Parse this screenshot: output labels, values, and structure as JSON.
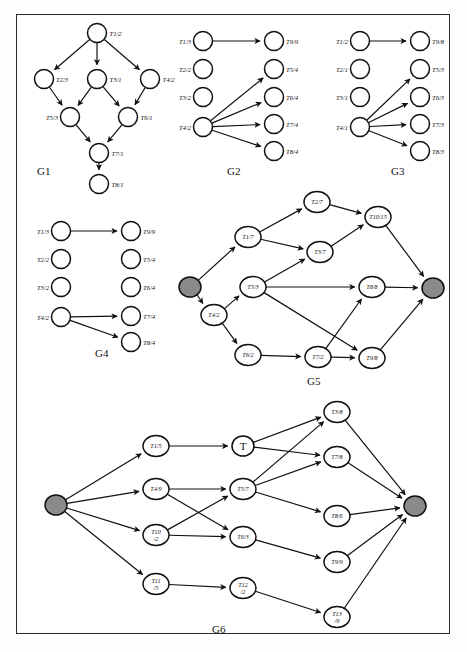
{
  "figure": {
    "background": "#ffffff",
    "border_color": "#2b2b2b",
    "node_fill": "#ffffff",
    "terminal_fill": "#8a8a8a",
    "edge_color": "#111111"
  },
  "captions": {
    "g1": "G1",
    "g2": "G2",
    "g3": "G3",
    "g4": "G4",
    "g5": "G5",
    "g6": "G6"
  },
  "graphs": {
    "g1": {
      "name": "G1",
      "label_position": "outside",
      "nodes": [
        {
          "id": "n1",
          "label": "T1/2",
          "x": 97,
          "y": 33
        },
        {
          "id": "n2",
          "label": "T2/3",
          "x": 44,
          "y": 79
        },
        {
          "id": "n3",
          "label": "T3/1",
          "x": 97,
          "y": 79
        },
        {
          "id": "n4",
          "label": "T4/2",
          "x": 150,
          "y": 79
        },
        {
          "id": "n5",
          "label": "T5/3",
          "x": 70,
          "y": 117
        },
        {
          "id": "n6",
          "label": "T6/1",
          "x": 128,
          "y": 117
        },
        {
          "id": "n7",
          "label": "T7/1",
          "x": 99,
          "y": 153
        },
        {
          "id": "n8",
          "label": "T8/1",
          "x": 99,
          "y": 184
        }
      ],
      "edges": [
        [
          "n1",
          "n2"
        ],
        [
          "n1",
          "n3"
        ],
        [
          "n1",
          "n4"
        ],
        [
          "n2",
          "n5"
        ],
        [
          "n3",
          "n5"
        ],
        [
          "n3",
          "n6"
        ],
        [
          "n4",
          "n6"
        ],
        [
          "n5",
          "n7"
        ],
        [
          "n6",
          "n7"
        ],
        [
          "n7",
          "n8"
        ]
      ]
    },
    "g2": {
      "name": "G2",
      "left_nodes": [
        {
          "id": "a1",
          "label": "T1/3",
          "x": 203,
          "y": 41
        },
        {
          "id": "a2",
          "label": "T2/2",
          "x": 203,
          "y": 69
        },
        {
          "id": "a3",
          "label": "T3/2",
          "x": 203,
          "y": 97
        },
        {
          "id": "a4",
          "label": "T4/2",
          "x": 203,
          "y": 127
        }
      ],
      "right_nodes": [
        {
          "id": "b9",
          "label": "T9/9",
          "x": 274,
          "y": 41
        },
        {
          "id": "b5",
          "label": "T5/4",
          "x": 274,
          "y": 69
        },
        {
          "id": "b6",
          "label": "T6/4",
          "x": 274,
          "y": 97
        },
        {
          "id": "b7",
          "label": "T7/4",
          "x": 274,
          "y": 124
        },
        {
          "id": "b8",
          "label": "T8/4",
          "x": 274,
          "y": 151
        }
      ],
      "edges": [
        [
          "a1",
          "b9"
        ],
        [
          "a4",
          "b5"
        ],
        [
          "a4",
          "b6"
        ],
        [
          "a4",
          "b7"
        ],
        [
          "a4",
          "b8"
        ]
      ]
    },
    "g3": {
      "name": "G3",
      "left_nodes": [
        {
          "id": "c1",
          "label": "T1/2",
          "x": 360,
          "y": 41
        },
        {
          "id": "c2",
          "label": "T2/1",
          "x": 360,
          "y": 69
        },
        {
          "id": "c3",
          "label": "T3/1",
          "x": 360,
          "y": 97
        },
        {
          "id": "c4",
          "label": "T4/1",
          "x": 360,
          "y": 127
        }
      ],
      "right_nodes": [
        {
          "id": "d9",
          "label": "T9/8",
          "x": 420,
          "y": 41
        },
        {
          "id": "d5",
          "label": "T5/3",
          "x": 420,
          "y": 69
        },
        {
          "id": "d6",
          "label": "T6/3",
          "x": 420,
          "y": 97
        },
        {
          "id": "d7",
          "label": "T7/3",
          "x": 420,
          "y": 124
        },
        {
          "id": "d8",
          "label": "T8/3",
          "x": 420,
          "y": 151
        }
      ],
      "edges": [
        [
          "c1",
          "d9"
        ],
        [
          "c4",
          "d5"
        ],
        [
          "c4",
          "d6"
        ],
        [
          "c4",
          "d7"
        ],
        [
          "c4",
          "d8"
        ]
      ]
    },
    "g4": {
      "name": "G4",
      "left_nodes": [
        {
          "id": "e1",
          "label": "T1/3",
          "x": 61,
          "y": 231
        },
        {
          "id": "e2",
          "label": "T2/2",
          "x": 61,
          "y": 259
        },
        {
          "id": "e3",
          "label": "T3/2",
          "x": 61,
          "y": 287
        },
        {
          "id": "e4",
          "label": "T4/2",
          "x": 61,
          "y": 317
        }
      ],
      "right_nodes": [
        {
          "id": "f9",
          "label": "T9/9",
          "x": 131,
          "y": 231
        },
        {
          "id": "f5",
          "label": "T5/4",
          "x": 131,
          "y": 259
        },
        {
          "id": "f6",
          "label": "T6/4",
          "x": 131,
          "y": 287
        },
        {
          "id": "f7",
          "label": "T7/4",
          "x": 131,
          "y": 316
        },
        {
          "id": "f8",
          "label": "T8/4",
          "x": 131,
          "y": 342
        }
      ],
      "edges": [
        [
          "e1",
          "f9"
        ],
        [
          "e4",
          "f7"
        ],
        [
          "e4",
          "f8"
        ]
      ]
    },
    "g5": {
      "name": "G5",
      "nodes": [
        {
          "id": "s",
          "label": "",
          "x": 190,
          "y": 287,
          "type": "terminal"
        },
        {
          "id": "t1",
          "label": "T1/7",
          "x": 248,
          "y": 237,
          "type": "task"
        },
        {
          "id": "t2",
          "label": "T2/7",
          "x": 317,
          "y": 202,
          "type": "task"
        },
        {
          "id": "t3",
          "label": "T3/7",
          "x": 320,
          "y": 252,
          "type": "task"
        },
        {
          "id": "t4",
          "label": "T4/2",
          "x": 214,
          "y": 315,
          "type": "task"
        },
        {
          "id": "t5",
          "label": "T5/3",
          "x": 253,
          "y": 287,
          "type": "task"
        },
        {
          "id": "t6",
          "label": "T6/2",
          "x": 248,
          "y": 355,
          "type": "task"
        },
        {
          "id": "t7",
          "label": "T7/2",
          "x": 318,
          "y": 357,
          "type": "task"
        },
        {
          "id": "t8",
          "label": "T8/8",
          "x": 372,
          "y": 287,
          "type": "task"
        },
        {
          "id": "t9",
          "label": "T9/8",
          "x": 372,
          "y": 358,
          "type": "task"
        },
        {
          "id": "t10",
          "label": "T10/15",
          "x": 378,
          "y": 217,
          "type": "task"
        },
        {
          "id": "e",
          "label": "",
          "x": 433,
          "y": 288,
          "type": "terminal"
        }
      ],
      "edges": [
        [
          "s",
          "t1"
        ],
        [
          "s",
          "t4"
        ],
        [
          "t1",
          "t2"
        ],
        [
          "t1",
          "t3"
        ],
        [
          "t4",
          "t5"
        ],
        [
          "t4",
          "t6"
        ],
        [
          "t5",
          "t3"
        ],
        [
          "t5",
          "t8"
        ],
        [
          "t5",
          "t9"
        ],
        [
          "t2",
          "t10"
        ],
        [
          "t3",
          "t10"
        ],
        [
          "t6",
          "t7"
        ],
        [
          "t7",
          "t8"
        ],
        [
          "t7",
          "t9"
        ],
        [
          "t10",
          "e"
        ],
        [
          "t8",
          "e"
        ],
        [
          "t9",
          "e"
        ]
      ]
    },
    "g6": {
      "name": "G6",
      "nodes": [
        {
          "id": "s",
          "label": "",
          "x": 56,
          "y": 505,
          "type": "terminal"
        },
        {
          "id": "u1",
          "label": "T1/5",
          "x": 156,
          "y": 446,
          "type": "task"
        },
        {
          "id": "u4",
          "label": "T4/9",
          "x": 156,
          "y": 489,
          "type": "task"
        },
        {
          "id": "u10",
          "label": "T10\n/2",
          "x": 156,
          "y": 535,
          "type": "task"
        },
        {
          "id": "u11",
          "label": "T11\n/5",
          "x": 156,
          "y": 584,
          "type": "task"
        },
        {
          "id": "u2",
          "label": "T",
          "x": 243,
          "y": 446,
          "type": "task-big"
        },
        {
          "id": "u5",
          "label": "T5/7",
          "x": 243,
          "y": 489,
          "type": "task"
        },
        {
          "id": "u6",
          "label": "T6/3",
          "x": 243,
          "y": 537,
          "type": "task"
        },
        {
          "id": "u12",
          "label": "T12\n/2",
          "x": 243,
          "y": 588,
          "type": "task"
        },
        {
          "id": "u3",
          "label": "T3/8",
          "x": 337,
          "y": 412,
          "type": "task"
        },
        {
          "id": "u7",
          "label": "T7/8",
          "x": 337,
          "y": 457,
          "type": "task"
        },
        {
          "id": "u8",
          "label": "T8/6",
          "x": 337,
          "y": 516,
          "type": "task"
        },
        {
          "id": "u9",
          "label": "T9/9",
          "x": 337,
          "y": 562,
          "type": "task"
        },
        {
          "id": "u13",
          "label": "T13\n/9",
          "x": 337,
          "y": 617,
          "type": "task"
        },
        {
          "id": "e",
          "label": "",
          "x": 415,
          "y": 506,
          "type": "terminal"
        }
      ],
      "edges": [
        [
          "s",
          "u1"
        ],
        [
          "s",
          "u4"
        ],
        [
          "s",
          "u10"
        ],
        [
          "s",
          "u11"
        ],
        [
          "u1",
          "u2"
        ],
        [
          "u4",
          "u5"
        ],
        [
          "u4",
          "u6"
        ],
        [
          "u10",
          "u5"
        ],
        [
          "u10",
          "u6"
        ],
        [
          "u11",
          "u12"
        ],
        [
          "u2",
          "u3"
        ],
        [
          "u2",
          "u7"
        ],
        [
          "u5",
          "u3"
        ],
        [
          "u5",
          "u7"
        ],
        [
          "u5",
          "u8"
        ],
        [
          "u6",
          "u9"
        ],
        [
          "u12",
          "u13"
        ],
        [
          "u3",
          "e"
        ],
        [
          "u7",
          "e"
        ],
        [
          "u8",
          "e"
        ],
        [
          "u9",
          "e"
        ],
        [
          "u13",
          "e"
        ]
      ]
    }
  }
}
